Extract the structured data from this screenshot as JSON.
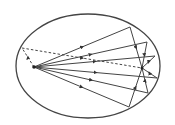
{
  "diagram": {
    "shape": "ellipse",
    "foci": [
      "F1",
      "F2"
    ],
    "solid_ray_count": 6,
    "dashed_ray_count": 1,
    "ray_direction": "from left focus, reflected off ellipse, converging at right focus",
    "stroke_color": "#444444",
    "background_color": "#ffffff"
  }
}
